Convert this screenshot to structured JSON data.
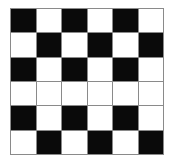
{
  "board": {
    "rows": 6,
    "cols": 6,
    "colors": {
      "B": "#0a0a0a",
      "W": "#ffffff",
      "grid_line": "#8a8a8a"
    },
    "cells": [
      [
        "B",
        "W",
        "B",
        "W",
        "B",
        "W"
      ],
      [
        "W",
        "B",
        "W",
        "B",
        "W",
        "B"
      ],
      [
        "B",
        "W",
        "B",
        "W",
        "B",
        "W"
      ],
      [
        "W",
        "W",
        "W",
        "W",
        "W",
        "W"
      ],
      [
        "B",
        "W",
        "B",
        "W",
        "B",
        "W"
      ],
      [
        "W",
        "B",
        "W",
        "B",
        "W",
        "B"
      ]
    ]
  }
}
